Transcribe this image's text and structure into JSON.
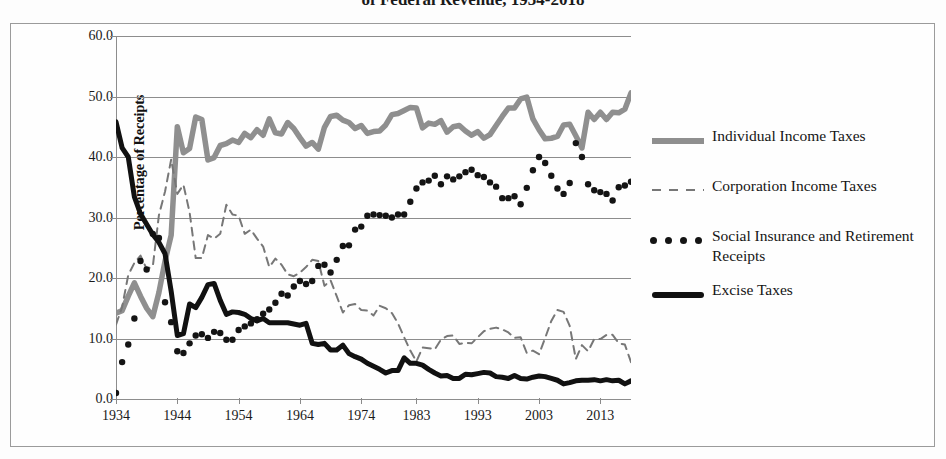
{
  "title": "of Federal Revenue, 1934-2018",
  "chart_data": {
    "type": "line",
    "title": "of Federal Revenue, 1934-2018",
    "xlabel": "",
    "ylabel": "Percentage of Receipts",
    "ylim": [
      0.0,
      60.0
    ],
    "yticks": [
      "0.0",
      "10.0",
      "20.0",
      "30.0",
      "40.0",
      "50.0",
      "60.0"
    ],
    "ytick_values": [
      0,
      10,
      20,
      30,
      40,
      50,
      60
    ],
    "xticks": [
      "1934",
      "1944",
      "1954",
      "1964",
      "1974",
      "1983",
      "1993",
      "2003",
      "2013"
    ],
    "xtick_values": [
      1934,
      1944,
      1954,
      1964,
      1974,
      1983,
      1993,
      2003,
      2013
    ],
    "xlim": [
      1934,
      2018
    ],
    "grid": true,
    "legend_position": "right",
    "series": [
      {
        "name": "Individual Income Taxes",
        "style": "solid-thick",
        "color": "#8f8f8f",
        "x": [
          1934,
          1935,
          1936,
          1937,
          1938,
          1939,
          1940,
          1941,
          1942,
          1943,
          1944,
          1945,
          1946,
          1947,
          1948,
          1949,
          1950,
          1951,
          1952,
          1953,
          1954,
          1955,
          1956,
          1957,
          1958,
          1959,
          1960,
          1961,
          1962,
          1963,
          1964,
          1965,
          1966,
          1967,
          1968,
          1969,
          1970,
          1971,
          1972,
          1973,
          1974,
          1975,
          1976,
          1977,
          1978,
          1979,
          1980,
          1981,
          1982,
          1983,
          1984,
          1985,
          1986,
          1987,
          1988,
          1989,
          1990,
          1991,
          1992,
          1993,
          1994,
          1995,
          1996,
          1997,
          1998,
          1999,
          2000,
          2001,
          2002,
          2003,
          2004,
          2005,
          2006,
          2007,
          2008,
          2009,
          2010,
          2011,
          2012,
          2013,
          2014,
          2015,
          2016,
          2017,
          2018
        ],
        "values": [
          14.2,
          14.6,
          17.0,
          19.2,
          17.0,
          15.0,
          13.6,
          17.6,
          22.8,
          27.1,
          45.0,
          40.7,
          41.4,
          46.6,
          46.2,
          39.5,
          39.9,
          41.9,
          42.2,
          42.8,
          42.4,
          43.9,
          43.2,
          44.5,
          43.6,
          46.3,
          44.0,
          43.8,
          45.7,
          44.7,
          43.2,
          41.8,
          42.4,
          41.3,
          44.9,
          46.7,
          46.9,
          46.1,
          45.7,
          44.7,
          45.2,
          43.9,
          44.2,
          44.3,
          45.3,
          47.0,
          47.2,
          47.7,
          48.2,
          48.1,
          44.8,
          45.6,
          45.4,
          46.0,
          44.1,
          45.0,
          45.2,
          44.3,
          43.6,
          44.2,
          43.1,
          43.7,
          45.2,
          46.7,
          48.1,
          48.1,
          49.6,
          49.9,
          46.3,
          44.5,
          43.0,
          43.1,
          43.4,
          45.3,
          45.4,
          43.5,
          41.5,
          47.4,
          46.2,
          47.4,
          46.2,
          47.4,
          47.3,
          47.9,
          50.6
        ]
      },
      {
        "name": "Corporation Income Taxes",
        "style": "dashed",
        "color": "#777777",
        "x": [
          1934,
          1935,
          1936,
          1937,
          1938,
          1939,
          1940,
          1941,
          1942,
          1943,
          1944,
          1945,
          1946,
          1947,
          1948,
          1949,
          1950,
          1951,
          1952,
          1953,
          1954,
          1955,
          1956,
          1957,
          1958,
          1959,
          1960,
          1961,
          1962,
          1963,
          1964,
          1965,
          1966,
          1967,
          1968,
          1969,
          1970,
          1971,
          1972,
          1973,
          1974,
          1975,
          1976,
          1977,
          1978,
          1979,
          1980,
          1981,
          1982,
          1983,
          1984,
          1985,
          1986,
          1987,
          1988,
          1989,
          1990,
          1991,
          1992,
          1993,
          1994,
          1995,
          1996,
          1997,
          1998,
          1999,
          2000,
          2001,
          2002,
          2003,
          2004,
          2005,
          2006,
          2007,
          2008,
          2009,
          2010,
          2011,
          2012,
          2013,
          2014,
          2015,
          2016,
          2017,
          2018
        ],
        "values": [
          12.3,
          15.2,
          20.5,
          22.5,
          23.7,
          21.5,
          21.9,
          30.4,
          34.3,
          39.6,
          33.9,
          35.4,
          30.9,
          23.3,
          23.3,
          27.1,
          26.5,
          27.3,
          32.1,
          30.5,
          30.3,
          27.3,
          28.0,
          26.5,
          25.2,
          21.8,
          23.2,
          22.2,
          20.6,
          20.3,
          20.9,
          21.8,
          23.0,
          22.8,
          18.7,
          19.6,
          17.0,
          14.3,
          15.5,
          15.7,
          14.7,
          14.6,
          13.8,
          15.4,
          15.0,
          14.2,
          12.5,
          10.2,
          8.0,
          6.2,
          8.5,
          8.4,
          8.2,
          9.8,
          10.4,
          10.5,
          9.1,
          9.3,
          9.2,
          10.2,
          11.2,
          11.6,
          11.8,
          11.5,
          11.0,
          10.1,
          10.2,
          7.6,
          8.0,
          7.4,
          10.1,
          12.9,
          14.7,
          14.4,
          12.1,
          6.6,
          8.9,
          7.9,
          9.9,
          9.9,
          10.6,
          10.6,
          9.2,
          9.0,
          6.1
        ]
      },
      {
        "name": "Social Insurance and Retirement Receipts",
        "style": "dotted",
        "color": "#141414",
        "x": [
          1934,
          1935,
          1936,
          1937,
          1938,
          1939,
          1940,
          1941,
          1942,
          1943,
          1944,
          1945,
          1946,
          1947,
          1948,
          1949,
          1950,
          1951,
          1952,
          1953,
          1954,
          1955,
          1956,
          1957,
          1958,
          1959,
          1960,
          1961,
          1962,
          1963,
          1964,
          1965,
          1966,
          1967,
          1968,
          1969,
          1970,
          1971,
          1972,
          1973,
          1974,
          1975,
          1976,
          1977,
          1978,
          1979,
          1980,
          1981,
          1982,
          1983,
          1984,
          1985,
          1986,
          1987,
          1988,
          1989,
          1990,
          1991,
          1992,
          1993,
          1994,
          1995,
          1996,
          1997,
          1998,
          1999,
          2000,
          2001,
          2002,
          2003,
          2004,
          2005,
          2006,
          2007,
          2008,
          2009,
          2010,
          2011,
          2012,
          2013,
          2014,
          2015,
          2016,
          2017,
          2018
        ],
        "values": [
          1.0,
          6.1,
          9.0,
          13.3,
          22.8,
          21.4,
          27.3,
          26.6,
          16.0,
          12.7,
          7.9,
          7.6,
          9.2,
          10.5,
          10.7,
          10.1,
          11.1,
          10.9,
          9.8,
          9.8,
          11.4,
          12.0,
          12.5,
          13.2,
          14.1,
          14.8,
          15.9,
          17.4,
          17.1,
          18.6,
          19.5,
          19.0,
          19.5,
          22.0,
          22.2,
          20.9,
          23.0,
          25.3,
          25.4,
          28.0,
          28.5,
          30.3,
          30.5,
          30.4,
          30.3,
          30.0,
          30.5,
          30.5,
          32.6,
          34.8,
          35.8,
          36.1,
          36.9,
          35.5,
          36.8,
          36.3,
          36.8,
          37.5,
          37.9,
          37.0,
          36.7,
          35.8,
          35.1,
          33.2,
          33.2,
          33.5,
          32.2,
          34.9,
          37.8,
          40.0,
          39.0,
          36.9,
          34.8,
          33.9,
          35.7,
          42.3,
          40.0,
          35.5,
          34.5,
          34.2,
          33.9,
          32.8,
          35.0,
          35.3,
          35.9
        ]
      },
      {
        "name": "Excise Taxes",
        "style": "solid-black-thick",
        "color": "#111111",
        "x": [
          1934,
          1935,
          1936,
          1937,
          1938,
          1939,
          1940,
          1941,
          1942,
          1943,
          1944,
          1945,
          1946,
          1947,
          1948,
          1949,
          1950,
          1951,
          1952,
          1953,
          1954,
          1955,
          1956,
          1957,
          1958,
          1959,
          1960,
          1961,
          1962,
          1963,
          1964,
          1965,
          1966,
          1967,
          1968,
          1969,
          1970,
          1971,
          1972,
          1973,
          1974,
          1975,
          1976,
          1977,
          1978,
          1979,
          1980,
          1981,
          1982,
          1983,
          1984,
          1985,
          1986,
          1987,
          1988,
          1989,
          1990,
          1991,
          1992,
          1993,
          1994,
          1995,
          1996,
          1997,
          1998,
          1999,
          2000,
          2001,
          2002,
          2003,
          2004,
          2005,
          2006,
          2007,
          2008,
          2009,
          2010,
          2011,
          2012,
          2013,
          2014,
          2015,
          2016,
          2017,
          2018
        ],
        "values": [
          45.8,
          41.5,
          40.0,
          33.4,
          30.6,
          28.9,
          27.2,
          25.9,
          24.0,
          17.8,
          10.5,
          10.8,
          15.7,
          15.1,
          16.8,
          18.9,
          19.1,
          16.3,
          14.0,
          14.4,
          14.3,
          14.0,
          13.3,
          12.9,
          13.3,
          12.6,
          12.6,
          12.6,
          12.6,
          12.4,
          12.2,
          12.5,
          9.2,
          9.0,
          9.2,
          8.1,
          8.1,
          8.9,
          7.5,
          7.0,
          6.6,
          5.9,
          5.4,
          4.9,
          4.3,
          4.7,
          4.7,
          6.8,
          5.9,
          5.9,
          5.6,
          4.9,
          4.3,
          3.8,
          3.9,
          3.4,
          3.4,
          4.1,
          4.0,
          4.2,
          4.4,
          4.3,
          3.7,
          3.6,
          3.4,
          3.9,
          3.4,
          3.3,
          3.6,
          3.8,
          3.7,
          3.4,
          3.1,
          2.5,
          2.7,
          3.0,
          3.1,
          3.1,
          3.2,
          3.0,
          3.2,
          3.0,
          3.1,
          2.5,
          3.0
        ]
      }
    ]
  },
  "legend": {
    "items": [
      {
        "label": "Individual Income Taxes",
        "key": "solid-gray"
      },
      {
        "label": "Corporation Income Taxes",
        "key": "dashed-gray"
      },
      {
        "label": "Social Insurance and Retirement Receipts",
        "key": "dotted-black"
      },
      {
        "label": "Excise Taxes",
        "key": "solid-black"
      }
    ]
  }
}
